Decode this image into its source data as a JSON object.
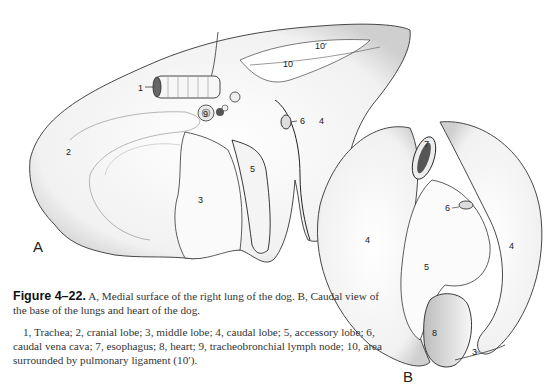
{
  "figure": {
    "number": "Figure 4–22.",
    "title": "A, Medial surface of the right lung of the dog. B, Caudal view of the base of the lungs and heart of the dog.",
    "legend": "1, Trachea; 2, cranial lobe; 3, middle lobe; 4, caudal lobe; 5, accessory lobe; 6, caudal vena cava; 7, esophagus; 8, heart; 9, tracheobronchial lymph node; 10, area surrounded by pulmonary ligament (10′).",
    "panels": {
      "a": "A",
      "b": "B"
    },
    "labels_a": {
      "trachea": "1",
      "cranial_lobe": "2",
      "middle_lobe": "3",
      "caudal_lobe": "4",
      "accessory_lobe": "5",
      "caudal_vena_cava": "6",
      "lymph_node": "9",
      "pulmonary_ligament": "10",
      "pulmonary_ligament_area": "10′"
    },
    "labels_b": {
      "caudal_lobe_left": "4",
      "caudal_lobe_right": "4",
      "accessory_lobe": "5",
      "caudal_vena_cava": "6",
      "esophagus": "7",
      "heart": "8",
      "middle_lobe": "3"
    }
  }
}
